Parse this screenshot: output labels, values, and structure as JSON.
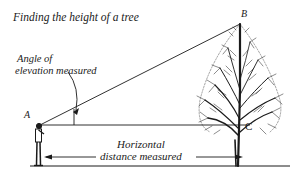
{
  "figure": {
    "title": "Finding the height of a tree",
    "labels": {
      "angle_line1": "Angle of",
      "angle_line2": "elevation measured",
      "point_a": "A",
      "point_b": "B",
      "point_c": "C",
      "distance_line1": "Horizontal",
      "distance_line2": "distance measured"
    },
    "elements": [
      "observer",
      "tree",
      "line-of-sight",
      "horizontal-line",
      "angle-arc",
      "distance-arrow",
      "ground"
    ],
    "colors": {
      "ink": "#1a1a1a",
      "background": "#ffffff"
    }
  }
}
